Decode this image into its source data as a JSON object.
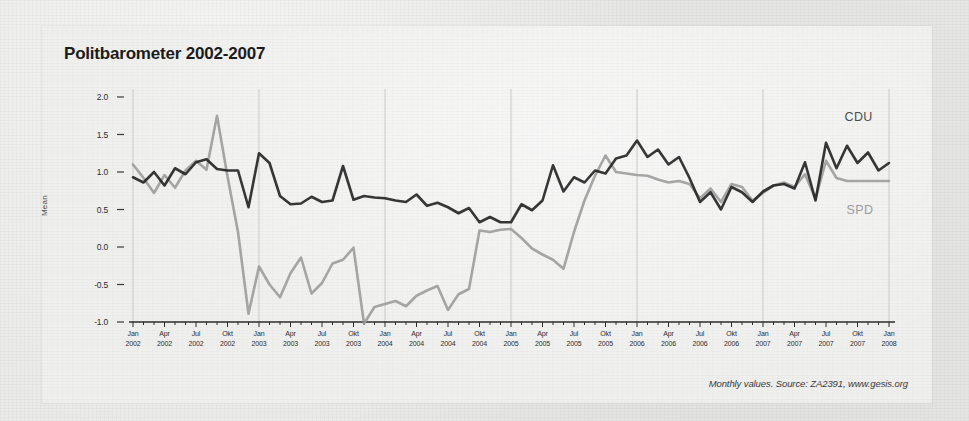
{
  "chart_data": {
    "type": "line",
    "title": "Politbarometer 2002-2007",
    "xlabel": "",
    "ylabel": "Mean",
    "ylim": [
      -1.0,
      2.0
    ],
    "yticks": [
      "2.0",
      "1.5",
      "1.0",
      "0.5",
      "0.0",
      "-0.5",
      "-1.0"
    ],
    "ytick_values": [
      2.0,
      1.5,
      1.0,
      0.5,
      0.0,
      -0.5,
      -1.0
    ],
    "grid": "vertical-yearly-faint",
    "legend_position": "inline-right",
    "x": [
      "Jan 2002",
      "Feb 2002",
      "Mar 2002",
      "Apr 2002",
      "Mai 2002",
      "Jun 2002",
      "Jul 2002",
      "Aug 2002",
      "Sep 2002",
      "Okt 2002",
      "Nov 2002",
      "Dez 2002",
      "Jan 2003",
      "Feb 2003",
      "Mar 2003",
      "Apr 2003",
      "Mai 2003",
      "Jun 2003",
      "Jul 2003",
      "Aug 2003",
      "Sep 2003",
      "Okt 2003",
      "Nov 2003",
      "Dez 2003",
      "Jan 2004",
      "Feb 2004",
      "Mar 2004",
      "Apr 2004",
      "Mai 2004",
      "Jun 2004",
      "Jul 2004",
      "Aug 2004",
      "Sep 2004",
      "Okt 2004",
      "Nov 2004",
      "Dez 2004",
      "Jan 2005",
      "Feb 2005",
      "Mar 2005",
      "Apr 2005",
      "Mai 2005",
      "Jun 2005",
      "Jul 2005",
      "Aug 2005",
      "Sep 2005",
      "Okt 2005",
      "Nov 2005",
      "Dez 2005",
      "Jan 2006",
      "Feb 2006",
      "Mar 2006",
      "Apr 2006",
      "Mai 2006",
      "Jun 2006",
      "Jul 2006",
      "Aug 2006",
      "Sep 2006",
      "Okt 2006",
      "Nov 2006",
      "Dez 2006",
      "Jan 2007",
      "Feb 2007",
      "Mar 2007",
      "Apr 2007",
      "Mai 2007",
      "Jun 2007",
      "Jul 2007",
      "Aug 2007",
      "Sep 2007",
      "Okt 2007",
      "Nov 2007",
      "Dez 2007",
      "Jan 2008"
    ],
    "xtick_labels": [
      {
        "month": "Jan",
        "year": "2002"
      },
      {
        "month": "Apr",
        "year": "2002"
      },
      {
        "month": "Jul",
        "year": "2002"
      },
      {
        "month": "Okt",
        "year": "2002"
      },
      {
        "month": "Jan",
        "year": "2003"
      },
      {
        "month": "Apr",
        "year": "2003"
      },
      {
        "month": "Jul",
        "year": "2003"
      },
      {
        "month": "Okt",
        "year": "2003"
      },
      {
        "month": "Jan",
        "year": "2004"
      },
      {
        "month": "Apr",
        "year": "2004"
      },
      {
        "month": "Jul",
        "year": "2004"
      },
      {
        "month": "Okt",
        "year": "2004"
      },
      {
        "month": "Jan",
        "year": "2005"
      },
      {
        "month": "Apr",
        "year": "2005"
      },
      {
        "month": "Jul",
        "year": "2005"
      },
      {
        "month": "Okt",
        "year": "2005"
      },
      {
        "month": "Jan",
        "year": "2006"
      },
      {
        "month": "Apr",
        "year": "2006"
      },
      {
        "month": "Jul",
        "year": "2006"
      },
      {
        "month": "Okt",
        "year": "2006"
      },
      {
        "month": "Jan",
        "year": "2007"
      },
      {
        "month": "Apr",
        "year": "2007"
      },
      {
        "month": "Jul",
        "year": "2007"
      },
      {
        "month": "Okt",
        "year": "2007"
      },
      {
        "month": "Jan",
        "year": "2008"
      }
    ],
    "series": [
      {
        "name": "CDU",
        "color": "#262626",
        "values": [
          0.93,
          0.86,
          1.0,
          0.82,
          1.05,
          0.97,
          1.13,
          1.17,
          1.04,
          1.02,
          1.02,
          0.53,
          1.25,
          1.12,
          0.68,
          0.57,
          0.58,
          0.67,
          0.6,
          0.62,
          1.08,
          0.63,
          0.68,
          0.66,
          0.65,
          0.62,
          0.6,
          0.7,
          0.55,
          0.59,
          0.53,
          0.45,
          0.52,
          0.33,
          0.4,
          0.33,
          0.33,
          0.57,
          0.49,
          0.62,
          1.09,
          0.74,
          0.93,
          0.86,
          1.02,
          0.98,
          1.18,
          1.22,
          1.42,
          1.2,
          1.3,
          1.1,
          1.2,
          0.92,
          0.6,
          0.73,
          0.5,
          0.8,
          0.73,
          0.6,
          0.74,
          0.82,
          0.84,
          0.78,
          1.13,
          0.62,
          1.39,
          1.05,
          1.35,
          1.12,
          1.26,
          1.02,
          1.12
        ]
      },
      {
        "name": "SPD",
        "color": "#9a9a9a",
        "values": [
          1.1,
          0.92,
          0.72,
          0.96,
          0.79,
          1.02,
          1.15,
          1.03,
          1.75,
          0.94,
          0.2,
          -0.89,
          -0.26,
          -0.5,
          -0.67,
          -0.35,
          -0.14,
          -0.62,
          -0.48,
          -0.22,
          -0.17,
          -0.01,
          -1.02,
          -0.8,
          -0.76,
          -0.72,
          -0.79,
          -0.65,
          -0.58,
          -0.52,
          -0.84,
          -0.63,
          -0.56,
          0.22,
          0.2,
          0.23,
          0.24,
          0.12,
          -0.02,
          -0.1,
          -0.17,
          -0.29,
          0.2,
          0.62,
          0.95,
          1.22,
          1.0,
          0.98,
          0.96,
          0.95,
          0.9,
          0.86,
          0.88,
          0.84,
          0.65,
          0.78,
          0.6,
          0.84,
          0.8,
          0.62,
          0.72,
          0.82,
          0.86,
          0.8,
          0.97,
          0.64,
          1.15,
          0.92,
          0.88,
          0.88,
          0.88,
          0.88,
          0.88
        ]
      }
    ],
    "annotations": [
      {
        "name": "CDU",
        "text": "CDU"
      },
      {
        "name": "SPD",
        "text": "SPD"
      }
    ],
    "footnote": "Monthly values. Source: ZA2391, www.gesis.org"
  }
}
